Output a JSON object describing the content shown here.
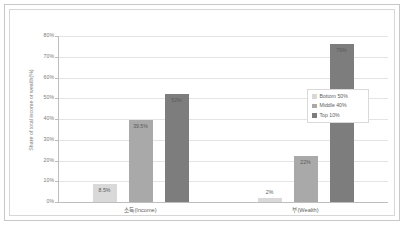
{
  "chart_data": {
    "type": "bar",
    "title": "",
    "subtitle": "",
    "xlabel": "",
    "ylabel": "Share of total income or wealth(%)",
    "ylim": [
      0,
      80
    ],
    "ytick_labels": [
      "80%",
      "70%",
      "60%",
      "50%",
      "40%",
      "30%",
      "20%",
      "10%",
      "0%"
    ],
    "ytick_values": [
      80,
      70,
      60,
      50,
      40,
      30,
      20,
      10,
      0
    ],
    "grid": true,
    "legend_position": "right",
    "categories": [
      "소득(Income)",
      "부(Wealth)"
    ],
    "series": [
      {
        "name": "Bottom 50%",
        "color": "#d9d9d9",
        "values": [
          8.5,
          2
        ],
        "labels": [
          "8.5%",
          "2%"
        ]
      },
      {
        "name": "Middle 40%",
        "color": "#a9a9a9",
        "values": [
          39.5,
          22
        ],
        "labels": [
          "39.5%",
          "22%"
        ]
      },
      {
        "name": "Top 10%",
        "color": "#7d7d7d",
        "values": [
          52,
          76
        ],
        "labels": [
          "52%",
          "76%"
        ]
      }
    ]
  },
  "colors": {
    "bottom50": "#d9d9d9",
    "middle40": "#a9a9a9",
    "top10": "#7d7d7d",
    "gridline": "#e4e4e4",
    "axis": "#bdbdbd",
    "text": "#7a7a7a",
    "frame": "#c8c8c8",
    "background": "#ffffff"
  },
  "legend": {
    "items": [
      {
        "label": "Bottom 50%"
      },
      {
        "label": "Middle 40%"
      },
      {
        "label": "Top 10%"
      }
    ]
  },
  "axis": {
    "y_title": "Share of total income or wealth(%)",
    "y_ticks": [
      "80%",
      "70%",
      "60%",
      "50%",
      "40%",
      "30%",
      "20%",
      "10%",
      "0%"
    ],
    "x_categories": [
      "소득(Income)",
      "부(Wealth)"
    ]
  }
}
